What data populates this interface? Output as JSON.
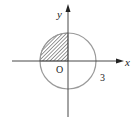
{
  "diagram": {
    "type": "coordinate-plane-circle",
    "axes": {
      "x_label": "x",
      "y_label": "y",
      "origin_label": "O"
    },
    "circle": {
      "center": [
        0,
        0
      ],
      "radius_label": "3",
      "stroke_color": "#9a9a9a"
    },
    "shaded_region": {
      "quadrant": "II",
      "fill": "diagonal-hatch",
      "color": "#333333"
    },
    "colors": {
      "axis": "#333333",
      "background": "#ffffff"
    }
  }
}
